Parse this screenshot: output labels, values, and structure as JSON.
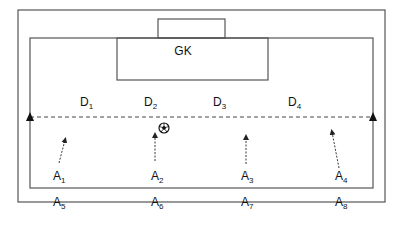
{
  "diagram": {
    "title": "",
    "colors": {
      "line": "#555555",
      "text": "#111111",
      "background": "#ffffff"
    },
    "goalkeeper": {
      "label": "GK"
    },
    "defenders": [
      {
        "base": "D",
        "sub": "1"
      },
      {
        "base": "D",
        "sub": "2"
      },
      {
        "base": "D",
        "sub": "3"
      },
      {
        "base": "D",
        "sub": "4"
      }
    ],
    "attackers_row1": [
      {
        "base": "A",
        "sub": "1"
      },
      {
        "base": "A",
        "sub": "2"
      },
      {
        "base": "A",
        "sub": "3"
      },
      {
        "base": "A",
        "sub": "4"
      }
    ],
    "attackers_row2": [
      {
        "base": "A",
        "sub": "5"
      },
      {
        "base": "A",
        "sub": "6"
      },
      {
        "base": "A",
        "sub": "7"
      },
      {
        "base": "A",
        "sub": "8"
      }
    ],
    "icons": {
      "ball": "soccer-ball-icon",
      "cone_left": "cone-marker-icon",
      "cone_right": "cone-marker-icon"
    }
  }
}
